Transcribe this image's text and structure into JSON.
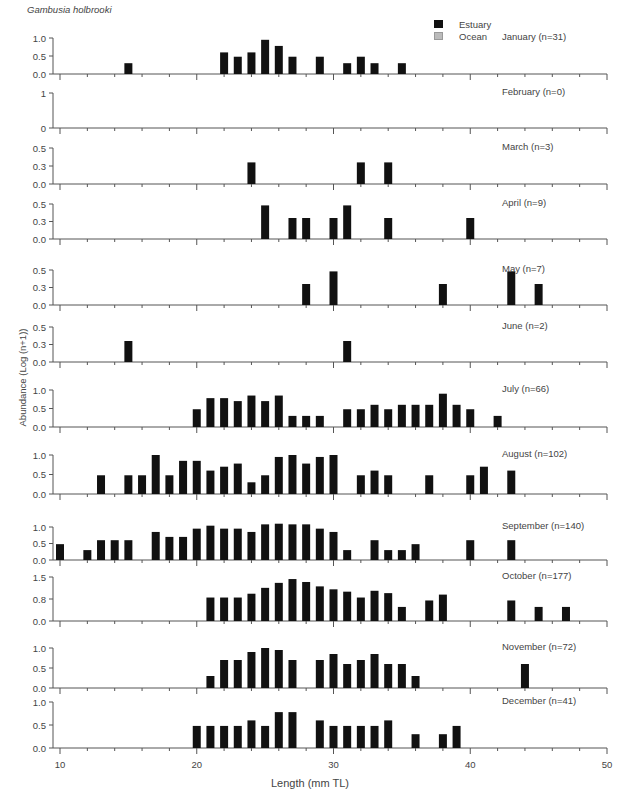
{
  "chart_data": {
    "type": "bar",
    "title": "Gambusia holbrooki",
    "xlabel": "Length (mm TL)",
    "ylabel": "Abundance (Log (n+1))",
    "xlim": [
      10,
      50
    ],
    "x_ticks": [
      10,
      20,
      30,
      40,
      50
    ],
    "grid": false,
    "legend": {
      "position": "top-right",
      "entries": [
        {
          "name": "Estuary",
          "color": "#111111"
        },
        {
          "name": "Ocean",
          "color": "#bbbbbb"
        }
      ]
    },
    "panels": [
      {
        "label": "January (n=31)",
        "yticks": [
          "0.0",
          "0.5",
          "1.0"
        ],
        "ymax": 1.0,
        "bars": [
          [
            15,
            0.3
          ],
          [
            22,
            0.6
          ],
          [
            23,
            0.48
          ],
          [
            24,
            0.6
          ],
          [
            25,
            0.95
          ],
          [
            26,
            0.78
          ],
          [
            27,
            0.48
          ],
          [
            29,
            0.48
          ],
          [
            31,
            0.3
          ],
          [
            32,
            0.48
          ],
          [
            33,
            0.3
          ],
          [
            35,
            0.3
          ]
        ]
      },
      {
        "label": "February (n=0)",
        "yticks": [
          "0",
          "1"
        ],
        "ymax": 1.0,
        "bars": []
      },
      {
        "label": "March (n=3)",
        "yticks": [
          "0.0",
          "0.3",
          "0.5"
        ],
        "ymax": 0.5,
        "bars": [
          [
            24,
            0.3
          ],
          [
            32,
            0.3
          ],
          [
            34,
            0.3
          ]
        ]
      },
      {
        "label": "April (n=9)",
        "yticks": [
          "0.0",
          "0.3",
          "0.5"
        ],
        "ymax": 0.5,
        "bars": [
          [
            25,
            0.48
          ],
          [
            27,
            0.3
          ],
          [
            28,
            0.3
          ],
          [
            30,
            0.3
          ],
          [
            31,
            0.48
          ],
          [
            34,
            0.3
          ],
          [
            40,
            0.3
          ]
        ]
      },
      {
        "label": "May (n=7)",
        "yticks": [
          "0.0",
          "0.3",
          "0.5"
        ],
        "ymax": 0.5,
        "bars": [
          [
            28,
            0.3
          ],
          [
            30,
            0.48
          ],
          [
            38,
            0.3
          ],
          [
            43,
            0.48
          ],
          [
            45,
            0.3
          ]
        ]
      },
      {
        "label": "June (n=2)",
        "yticks": [
          "0.0",
          "0.3",
          "0.5"
        ],
        "ymax": 0.5,
        "bars": [
          [
            15,
            0.3
          ],
          [
            31,
            0.3
          ]
        ]
      },
      {
        "label": "July (n=66)",
        "yticks": [
          "0.0",
          "0.5",
          "1.0"
        ],
        "ymax": 1.0,
        "bars": [
          [
            20,
            0.48
          ],
          [
            21,
            0.78
          ],
          [
            22,
            0.78
          ],
          [
            23,
            0.7
          ],
          [
            24,
            0.85
          ],
          [
            25,
            0.7
          ],
          [
            26,
            0.85
          ],
          [
            27,
            0.3
          ],
          [
            28,
            0.3
          ],
          [
            29,
            0.3
          ],
          [
            31,
            0.48
          ],
          [
            32,
            0.48
          ],
          [
            33,
            0.6
          ],
          [
            34,
            0.48
          ],
          [
            35,
            0.6
          ],
          [
            36,
            0.6
          ],
          [
            37,
            0.6
          ],
          [
            38,
            0.9
          ],
          [
            39,
            0.6
          ],
          [
            40,
            0.48
          ],
          [
            42,
            0.3
          ]
        ]
      },
      {
        "label": "August (n=102)",
        "yticks": [
          "0.0",
          "0.5",
          "1.0"
        ],
        "ymax": 1.0,
        "bars": [
          [
            13,
            0.48
          ],
          [
            15,
            0.48
          ],
          [
            16,
            0.48
          ],
          [
            17,
            1.0
          ],
          [
            18,
            0.48
          ],
          [
            19,
            0.85
          ],
          [
            20,
            0.85
          ],
          [
            21,
            0.6
          ],
          [
            22,
            0.7
          ],
          [
            23,
            0.78
          ],
          [
            24,
            0.3
          ],
          [
            25,
            0.48
          ],
          [
            26,
            0.95
          ],
          [
            27,
            1.0
          ],
          [
            28,
            0.78
          ],
          [
            29,
            0.95
          ],
          [
            30,
            1.0
          ],
          [
            32,
            0.48
          ],
          [
            33,
            0.6
          ],
          [
            34,
            0.48
          ],
          [
            37,
            0.48
          ],
          [
            40,
            0.48
          ],
          [
            41,
            0.7
          ],
          [
            43,
            0.6
          ]
        ]
      },
      {
        "label": "September (n=140)",
        "yticks": [
          "0.0",
          "0.5",
          "1.0"
        ],
        "ymax": 1.0,
        "bars": [
          [
            10,
            0.48
          ],
          [
            12,
            0.3
          ],
          [
            13,
            0.6
          ],
          [
            14,
            0.6
          ],
          [
            15,
            0.6
          ],
          [
            17,
            0.85
          ],
          [
            18,
            0.7
          ],
          [
            19,
            0.7
          ],
          [
            20,
            0.95
          ],
          [
            21,
            1.04
          ],
          [
            22,
            0.95
          ],
          [
            23,
            0.95
          ],
          [
            24,
            0.85
          ],
          [
            25,
            1.08
          ],
          [
            26,
            1.1
          ],
          [
            27,
            1.08
          ],
          [
            28,
            1.08
          ],
          [
            29,
            0.95
          ],
          [
            30,
            0.85
          ],
          [
            31,
            0.3
          ],
          [
            33,
            0.6
          ],
          [
            34,
            0.3
          ],
          [
            35,
            0.3
          ],
          [
            36,
            0.48
          ],
          [
            40,
            0.6
          ],
          [
            43,
            0.6
          ]
        ]
      },
      {
        "label": "October (n=177)",
        "yticks": [
          "0.0",
          "0.8",
          "1.5"
        ],
        "ymax": 1.5,
        "bars": [
          [
            21,
            0.8
          ],
          [
            22,
            0.8
          ],
          [
            23,
            0.8
          ],
          [
            24,
            0.93
          ],
          [
            25,
            1.13
          ],
          [
            26,
            1.3
          ],
          [
            27,
            1.43
          ],
          [
            28,
            1.33
          ],
          [
            29,
            1.18
          ],
          [
            30,
            1.08
          ],
          [
            31,
            1.0
          ],
          [
            32,
            0.8
          ],
          [
            33,
            1.03
          ],
          [
            34,
            0.95
          ],
          [
            35,
            0.48
          ],
          [
            37,
            0.7
          ],
          [
            38,
            0.9
          ],
          [
            43,
            0.7
          ],
          [
            45,
            0.48
          ],
          [
            47,
            0.48
          ]
        ]
      },
      {
        "label": "November (n=72)",
        "yticks": [
          "0.0",
          "0.5",
          "1.0"
        ],
        "ymax": 1.0,
        "bars": [
          [
            21,
            0.3
          ],
          [
            22,
            0.7
          ],
          [
            23,
            0.7
          ],
          [
            24,
            0.9
          ],
          [
            25,
            1.0
          ],
          [
            26,
            0.95
          ],
          [
            27,
            0.7
          ],
          [
            29,
            0.7
          ],
          [
            30,
            0.85
          ],
          [
            31,
            0.6
          ],
          [
            32,
            0.7
          ],
          [
            33,
            0.85
          ],
          [
            34,
            0.6
          ],
          [
            35,
            0.6
          ],
          [
            36,
            0.3
          ],
          [
            44,
            0.6
          ]
        ]
      },
      {
        "label": "December (n=41)",
        "yticks": [
          "0.0",
          "0.5",
          "1.0"
        ],
        "ymax": 1.0,
        "bars": [
          [
            20,
            0.48
          ],
          [
            21,
            0.48
          ],
          [
            22,
            0.48
          ],
          [
            23,
            0.48
          ],
          [
            24,
            0.6
          ],
          [
            25,
            0.48
          ],
          [
            26,
            0.78
          ],
          [
            27,
            0.78
          ],
          [
            29,
            0.6
          ],
          [
            30,
            0.48
          ],
          [
            31,
            0.48
          ],
          [
            32,
            0.48
          ],
          [
            33,
            0.48
          ],
          [
            34,
            0.6
          ],
          [
            36,
            0.3
          ],
          [
            38,
            0.3
          ],
          [
            39,
            0.48
          ]
        ]
      }
    ]
  },
  "layout": {
    "panels_px": [
      {
        "base": 74,
        "top": 38
      },
      {
        "base": 128,
        "top": 93
      },
      {
        "base": 184,
        "top": 148
      },
      {
        "base": 239,
        "top": 204
      },
      {
        "base": 305,
        "top": 270
      },
      {
        "base": 362,
        "top": 327
      },
      {
        "base": 427,
        "top": 390
      },
      {
        "base": 494,
        "top": 455
      },
      {
        "base": 560,
        "top": 527
      },
      {
        "base": 621,
        "top": 577
      },
      {
        "base": 688,
        "top": 648
      },
      {
        "base": 748,
        "top": 702
      }
    ]
  }
}
